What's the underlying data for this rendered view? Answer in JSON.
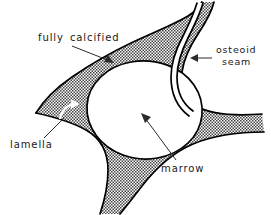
{
  "figure": {
    "background_color": "#ffffff",
    "ink_color": "#000000",
    "stipple_color": "#3a3a3a",
    "cavity_fill": "#ffffff",
    "width": 271,
    "height": 215
  },
  "labels": {
    "fully_calcified": "fully  calcified",
    "osteoid_seam_line1": "osteoid",
    "osteoid_seam_line2": "seam",
    "lamella": "lamella",
    "marrow": "marrow"
  },
  "annotations": [
    {
      "name": "fully-calcified",
      "text": "fully  calcified",
      "label_x": 38,
      "label_y": 41,
      "arrow_from": [
        72,
        45
      ],
      "arrow_to": [
        113,
        62
      ],
      "arrow_style": "straight-arrow",
      "points_to": "calcified trabecular matrix (stippled region)"
    },
    {
      "name": "osteoid-seam",
      "text": "osteoid seam",
      "label_x": 216,
      "label_y": 55,
      "arrow_from": [
        211,
        59
      ],
      "arrow_to": [
        192,
        59
      ],
      "arrow_style": "straight-arrow",
      "points_to": "thin unmineralized band on right trabecula"
    },
    {
      "name": "lamella",
      "text": "lamella",
      "label_x": 10,
      "label_y": 148,
      "arrow_from": [
        44,
        137
      ],
      "arrow_to": [
        70,
        112
      ],
      "arrow_style": "curved-hook-arrow",
      "points_to": "layered bone lamella inside matrix"
    },
    {
      "name": "marrow",
      "text": "marrow",
      "label_x": 162,
      "label_y": 172,
      "arrow_from": [
        176,
        160
      ],
      "arrow_to": [
        141,
        114
      ],
      "arrow_style": "straight-arrow",
      "points_to": "central white marrow cavity"
    }
  ],
  "regions": {
    "calcified_matrix": "stippled dotted region forming a three-armed trabecular network",
    "marrow_cavity": "large white rounded cavity at centre",
    "osteoid_seam": "narrow white strip bounded by two thin lines at the right edge"
  }
}
